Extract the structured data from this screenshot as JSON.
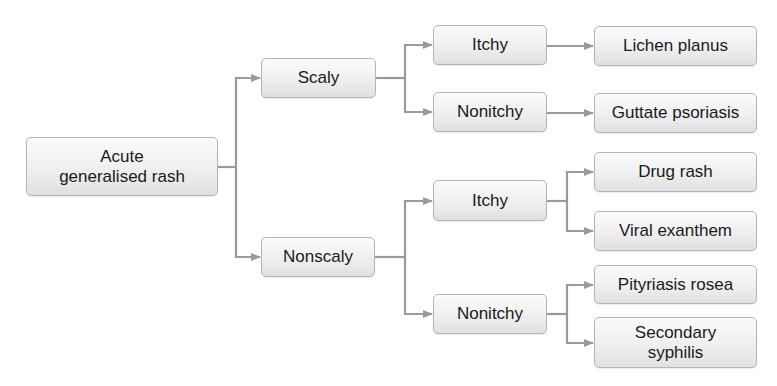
{
  "diagram": {
    "type": "flowchart",
    "title": "",
    "colors": {
      "connector": "#9a9a9a",
      "node_border": "#b4b4b4",
      "node_fill_top": "#fbfbfb",
      "node_fill_bottom": "#e0e0e0",
      "text": "#1a1a1a"
    },
    "nodes": {
      "root": {
        "label": "Acute generalised rash",
        "line1": "Acute",
        "line2": "generalised rash"
      },
      "scaly": {
        "label": "Scaly"
      },
      "nonscaly": {
        "label": "Nonscaly"
      },
      "scaly_itchy": {
        "label": "Itchy"
      },
      "scaly_nonitchy": {
        "label": "Nonitchy"
      },
      "nonscaly_itchy": {
        "label": "Itchy"
      },
      "nonscaly_nonitchy": {
        "label": "Nonitchy"
      },
      "lichen_planus": {
        "label": "Lichen planus"
      },
      "guttate_psoriasis": {
        "label": "Guttate psoriasis"
      },
      "drug_rash": {
        "label": "Drug rash"
      },
      "viral_exanthem": {
        "label": "Viral exanthem"
      },
      "pityriasis_rosea": {
        "label": "Pityriasis rosea"
      },
      "secondary_syphilis": {
        "label": "Secondary syphilis",
        "line1": "Secondary",
        "line2": "syphilis"
      }
    },
    "edges": [
      {
        "from": "root",
        "to": "scaly"
      },
      {
        "from": "root",
        "to": "nonscaly"
      },
      {
        "from": "scaly",
        "to": "scaly_itchy"
      },
      {
        "from": "scaly",
        "to": "scaly_nonitchy"
      },
      {
        "from": "scaly_itchy",
        "to": "lichen_planus"
      },
      {
        "from": "scaly_nonitchy",
        "to": "guttate_psoriasis"
      },
      {
        "from": "nonscaly",
        "to": "nonscaly_itchy"
      },
      {
        "from": "nonscaly",
        "to": "nonscaly_nonitchy"
      },
      {
        "from": "nonscaly_itchy",
        "to": "drug_rash"
      },
      {
        "from": "nonscaly_itchy",
        "to": "viral_exanthem"
      },
      {
        "from": "nonscaly_nonitchy",
        "to": "pityriasis_rosea"
      },
      {
        "from": "nonscaly_nonitchy",
        "to": "secondary_syphilis"
      }
    ]
  }
}
